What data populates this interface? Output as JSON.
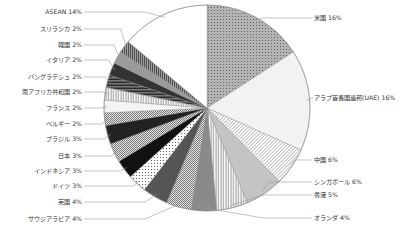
{
  "chart_data": {
    "type": "pie",
    "title": "",
    "start_angle_deg": 0,
    "direction": "clockwise",
    "categories": [
      "米国",
      "アラブ首長国連邦(UAE)",
      "中国",
      "シンガポール",
      "香港",
      "オランダ",
      "サウジアラビア",
      "英国",
      "ドイツ",
      "インドネシア",
      "日本",
      "ブラジル",
      "ベルギー",
      "フランス",
      "南アフリカ共和国",
      "バングラデシュ",
      "イタリア",
      "韓国",
      "スリランカ",
      "ASEAN"
    ],
    "values": [
      16,
      16,
      6,
      6,
      5,
      4,
      4,
      4,
      3,
      3,
      3,
      3,
      2,
      2,
      2,
      2,
      2,
      2,
      2,
      14
    ],
    "unit": "%",
    "legend": "none (leader-line labels)",
    "slices": [
      {
        "label": "米国",
        "value": 16,
        "text": "米国  16%",
        "fill": "#b8b8b8",
        "pattern": "dots",
        "side": "right",
        "ly": 18
      },
      {
        "label": "アラブ首長国連邦(UAE)",
        "value": 16,
        "text": "アラブ首長国連邦(UAE)  16%",
        "fill": "#f2f2f2",
        "pattern": "none",
        "side": "right",
        "ly": 98
      },
      {
        "label": "中国",
        "value": 6,
        "text": "中国  6%",
        "fill": "#ffffff",
        "pattern": "diag",
        "side": "right",
        "ly": 160
      },
      {
        "label": "シンガポール",
        "value": 6,
        "text": "シンガポール  6%",
        "fill": "#c4c4c4",
        "pattern": "none",
        "side": "right",
        "ly": 182
      },
      {
        "label": "香港",
        "value": 5,
        "text": "香港  5%",
        "fill": "#ffffff",
        "pattern": "vlines",
        "side": "right",
        "ly": 195
      },
      {
        "label": "オランダ",
        "value": 4,
        "text": "オランダ  4%",
        "fill": "#8a8a8a",
        "pattern": "none",
        "side": "right",
        "ly": 218
      },
      {
        "label": "サウジアラビア",
        "value": 4,
        "text": "サウジアラビア  4%",
        "fill": "#d0d0d0",
        "pattern": "check",
        "side": "left",
        "ly": 219
      },
      {
        "label": "英国",
        "value": 4,
        "text": "英国  4%",
        "fill": "#555555",
        "pattern": "none",
        "side": "left",
        "ly": 202
      },
      {
        "label": "ドイツ",
        "value": 3,
        "text": "ドイツ  3%",
        "fill": "#ffffff",
        "pattern": "dots",
        "side": "left",
        "ly": 186
      },
      {
        "label": "インドネシア",
        "value": 3,
        "text": "インドネシア  3%",
        "fill": "#111111",
        "pattern": "none",
        "side": "left",
        "ly": 171
      },
      {
        "label": "日本",
        "value": 3,
        "text": "日本  3%",
        "fill": "#d8d8d8",
        "pattern": "check",
        "side": "left",
        "ly": 156
      },
      {
        "label": "ブラジル",
        "value": 3,
        "text": "ブラジル  3%",
        "fill": "#222222",
        "pattern": "none",
        "side": "left",
        "ly": 139
      },
      {
        "label": "ベルギー",
        "value": 2,
        "text": "ベルギー  2%",
        "fill": "#c8c8c8",
        "pattern": "check",
        "side": "left",
        "ly": 124
      },
      {
        "label": "フランス",
        "value": 2,
        "text": "フランス  2%",
        "fill": "#f4f4f4",
        "pattern": "none",
        "side": "left",
        "ly": 108
      },
      {
        "label": "南アフリカ共和国",
        "value": 2,
        "text": "南アフリカ共和国  2%",
        "fill": "#bbbbbb",
        "pattern": "vlines",
        "side": "left",
        "ly": 92
      },
      {
        "label": "バングラデシュ",
        "value": 2,
        "text": "バングラデシュ  2%",
        "fill": "#444444",
        "pattern": "hlines",
        "side": "left",
        "ly": 77
      },
      {
        "label": "イタリア",
        "value": 2,
        "text": "イタリア  2%",
        "fill": "#333333",
        "pattern": "none",
        "side": "left",
        "ly": 60
      },
      {
        "label": "韓国",
        "value": 2,
        "text": "韓国  2%",
        "fill": "#9a9a9a",
        "pattern": "none",
        "side": "left",
        "ly": 45
      },
      {
        "label": "スリランカ",
        "value": 2,
        "text": "スリランカ  2%",
        "fill": "#ffffff",
        "pattern": "vlines-dark",
        "side": "left",
        "ly": 29
      },
      {
        "label": "ASEAN",
        "value": 14,
        "text": "ASEAN  14%",
        "fill": "#ffffff",
        "pattern": "none",
        "side": "left",
        "ly": 12
      }
    ],
    "geometry": {
      "cx": 207,
      "cy": 108,
      "r": 103
    }
  }
}
